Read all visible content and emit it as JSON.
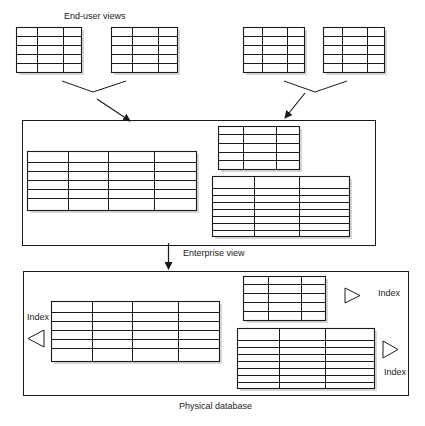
{
  "labels": {
    "end_user_views": "End-user views",
    "enterprise_view": "Enterprise view",
    "physical_database": "Physical database",
    "index_left": "Index",
    "index_top_right": "Index",
    "index_bottom_right": "Index"
  },
  "colors": {
    "line": "#1a1a1a",
    "shadow": "#d8d8d8",
    "background": "#ffffff"
  },
  "end_user_tables": [
    {
      "x": 16,
      "y": 27,
      "w": 65,
      "h": 45,
      "cols": [
        37,
        63
      ],
      "rows": [
        36,
        45,
        54,
        63
      ]
    },
    {
      "x": 111,
      "y": 27,
      "w": 66,
      "h": 45,
      "cols": [
        132,
        158
      ],
      "rows": [
        36,
        45,
        54,
        63
      ]
    },
    {
      "x": 243,
      "y": 27,
      "w": 61,
      "h": 45,
      "cols": [
        262,
        287
      ],
      "rows": [
        36,
        45,
        54,
        63
      ]
    },
    {
      "x": 323,
      "y": 27,
      "w": 61,
      "h": 45,
      "cols": [
        342,
        367
      ],
      "rows": [
        36,
        45,
        54,
        63
      ]
    }
  ],
  "enterprise_tables": [
    {
      "x": 27,
      "y": 151,
      "w": 169,
      "h": 59,
      "cols": [
        68,
        108,
        154
      ],
      "rows": [
        162,
        171,
        180,
        189,
        198
      ]
    },
    {
      "x": 218,
      "y": 126,
      "w": 81,
      "h": 43,
      "cols": [
        243,
        276
      ],
      "rows": [
        134,
        143,
        152,
        160
      ]
    },
    {
      "x": 212,
      "y": 176,
      "w": 137,
      "h": 60,
      "cols": [
        254,
        299
      ],
      "rows": [
        188,
        195,
        202,
        209,
        216,
        223,
        230
      ]
    }
  ],
  "physical_tables": [
    {
      "x": 51,
      "y": 301,
      "w": 168,
      "h": 60,
      "cols": [
        92,
        132,
        178
      ],
      "rows": [
        312,
        321,
        330,
        339,
        348
      ]
    },
    {
      "x": 243,
      "y": 276,
      "w": 82,
      "h": 44,
      "cols": [
        268,
        301
      ],
      "rows": [
        284,
        293,
        302,
        311
      ]
    },
    {
      "x": 237,
      "y": 328,
      "w": 137,
      "h": 60,
      "cols": [
        279,
        325
      ],
      "rows": [
        340,
        347,
        354,
        361,
        368,
        375,
        382
      ]
    }
  ]
}
